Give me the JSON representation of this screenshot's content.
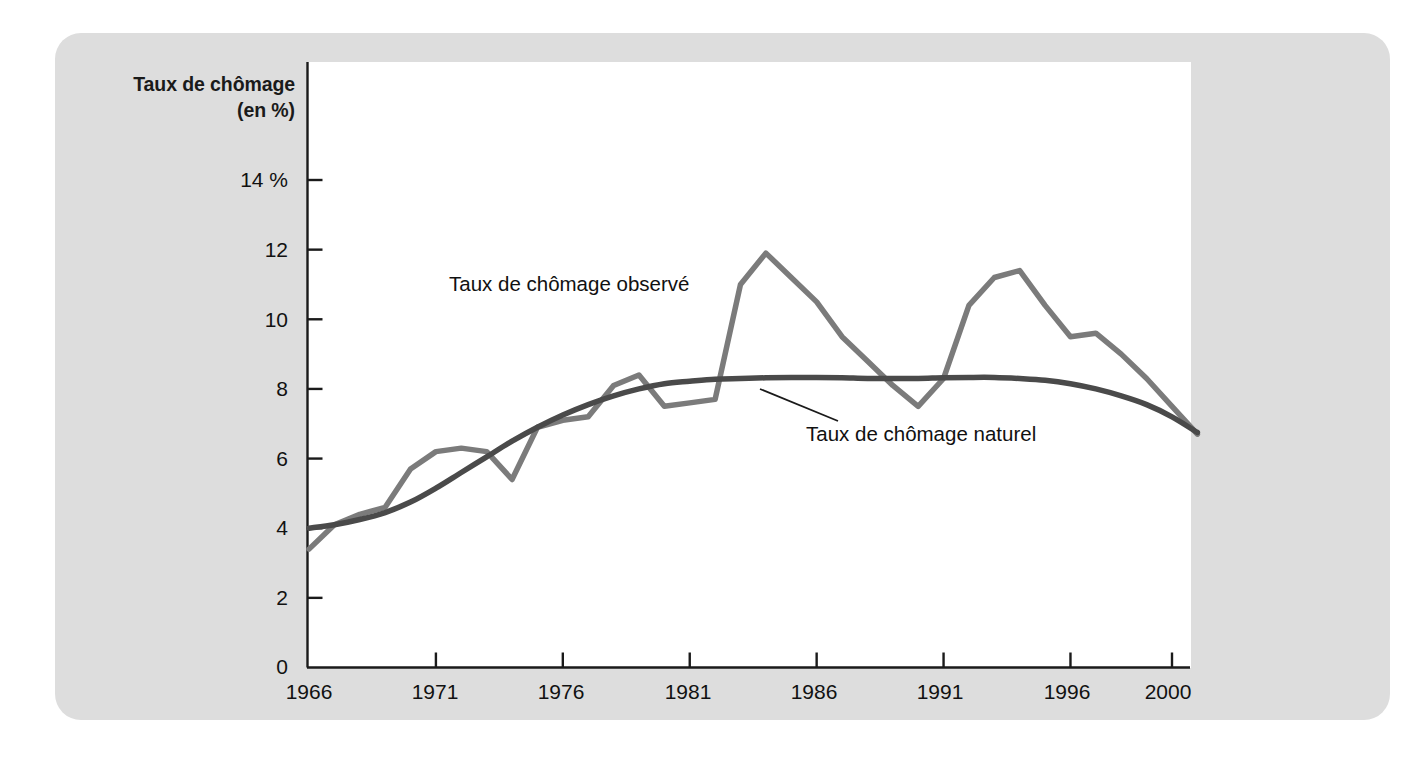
{
  "figure": {
    "background_color": "#ffffff",
    "panel_color": "#dddddd",
    "plot_color": "#ffffff"
  },
  "chart_data": {
    "type": "line",
    "title": "",
    "subtitle": "",
    "ylabel_line1": "Taux de chômage",
    "ylabel_line2": "(en %)",
    "xlabel": "",
    "grid": false,
    "legend_position": "inline-annotations",
    "xlim": [
      1966,
      2001
    ],
    "ylim": [
      0,
      15
    ],
    "ytick_labels": [
      "0",
      "2",
      "4",
      "6",
      "8",
      "10",
      "12",
      "14 %"
    ],
    "ytick_values": [
      0,
      2,
      4,
      6,
      8,
      10,
      12,
      14
    ],
    "xtick_labels": [
      "1966",
      "1971",
      "1976",
      "1981",
      "1986",
      "1991",
      "1996",
      "2000"
    ],
    "xtick_values": [
      1966,
      1971,
      1976,
      1981,
      1986,
      1991,
      1996,
      2000
    ],
    "x": [
      1966,
      1967,
      1968,
      1969,
      1970,
      1971,
      1972,
      1973,
      1974,
      1975,
      1976,
      1977,
      1978,
      1979,
      1980,
      1981,
      1982,
      1983,
      1984,
      1985,
      1986,
      1987,
      1988,
      1989,
      1990,
      1991,
      1992,
      1993,
      1994,
      1995,
      1996,
      1997,
      1998,
      1999,
      2000,
      2001
    ],
    "series": [
      {
        "name": "Taux de chômage observé",
        "color": "#7b7b7b",
        "line_width": 5.5,
        "smooth": false,
        "values": [
          3.4,
          4.1,
          4.4,
          4.6,
          5.7,
          6.2,
          6.3,
          6.2,
          5.4,
          6.9,
          7.1,
          7.2,
          8.1,
          8.4,
          7.5,
          7.6,
          7.7,
          11.0,
          11.9,
          11.2,
          10.5,
          9.5,
          8.8,
          8.1,
          7.5,
          8.3,
          10.4,
          11.2,
          11.4,
          10.4,
          9.5,
          9.6,
          9.0,
          8.3,
          7.5,
          6.7
        ]
      },
      {
        "name": "Taux de chômage naturel",
        "color": "#4a4a4a",
        "line_width": 5.5,
        "smooth": true,
        "values": [
          4.0,
          4.1,
          4.25,
          4.45,
          4.75,
          5.15,
          5.6,
          6.05,
          6.5,
          6.9,
          7.25,
          7.55,
          7.8,
          8.0,
          8.15,
          8.22,
          8.28,
          8.3,
          8.32,
          8.33,
          8.33,
          8.32,
          8.3,
          8.3,
          8.3,
          8.32,
          8.33,
          8.33,
          8.3,
          8.25,
          8.15,
          8.0,
          7.8,
          7.55,
          7.2,
          6.75
        ]
      }
    ],
    "annotations": [
      {
        "name": "observed-series-label",
        "text": "Taux de chômage observé",
        "x_px": 449,
        "y_px": 283
      },
      {
        "name": "natural-series-label",
        "text": "Taux de chômage naturel",
        "x_px": 806,
        "y_px": 433
      }
    ],
    "leader_line": {
      "from_x_px": 838,
      "from_y_px": 421,
      "to_x_px": 760,
      "to_y_px": 389
    }
  }
}
